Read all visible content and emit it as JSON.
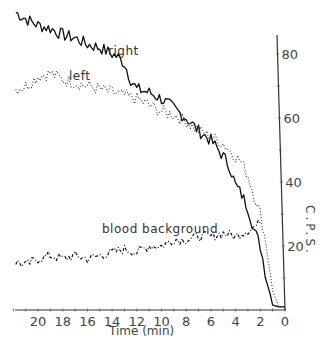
{
  "chart_data": {
    "type": "line",
    "title": "",
    "xlabel": "Time (min)",
    "ylabel": "C.P.S.",
    "x_reversed": true,
    "xlim": [
      22,
      0
    ],
    "ylim": [
      0,
      90
    ],
    "x_ticks": [
      20,
      18,
      16,
      14,
      12,
      10,
      8,
      6,
      4,
      2,
      0
    ],
    "y_ticks": [
      20,
      40,
      60,
      80
    ],
    "y_axis_position": "right",
    "grid": false,
    "legend": "inline labels",
    "series": [
      {
        "name": "right",
        "style": "solid",
        "x": [
          21.8,
          21,
          20,
          19,
          18,
          17,
          16,
          15,
          14,
          13.5,
          13,
          12.5,
          12,
          11,
          10,
          9,
          8,
          7,
          6,
          5,
          4.5,
          4,
          3.5,
          3,
          2.5,
          2,
          1.6,
          1.2,
          1.0,
          0.5,
          0
        ],
        "values": [
          93,
          91,
          89,
          88,
          86,
          85,
          83,
          82,
          80,
          79,
          77,
          72,
          69,
          68,
          66,
          63,
          60,
          56,
          53,
          48,
          45,
          39,
          36,
          32,
          25,
          20,
          12,
          5,
          1.5,
          1,
          1
        ]
      },
      {
        "name": "left",
        "style": "dotted",
        "x": [
          21.8,
          21,
          20,
          19,
          18,
          17,
          16,
          15,
          14,
          13,
          12,
          11,
          10,
          9,
          8,
          7,
          6,
          5,
          4,
          3.5,
          3,
          2.5,
          2,
          1.5,
          1.0,
          0.5,
          0
        ],
        "values": [
          69,
          70,
          73,
          74,
          72,
          71,
          70,
          69,
          68,
          67,
          66,
          64,
          62,
          61,
          59,
          56,
          54,
          52,
          48,
          46,
          42,
          36,
          30,
          20,
          6,
          1,
          1
        ]
      },
      {
        "name": "blood background",
        "style": "dash-dot",
        "x": [
          21.8,
          21,
          20,
          19,
          18,
          17,
          16,
          15,
          14,
          13,
          12,
          11,
          10,
          9,
          8,
          7,
          6,
          5,
          4,
          3,
          2.5,
          2
        ],
        "values": [
          15,
          14,
          16,
          17,
          16,
          17,
          16,
          17,
          18,
          19,
          18,
          20,
          20,
          22,
          22,
          23,
          23,
          24,
          23,
          25,
          26,
          27
        ]
      }
    ],
    "annotations": [
      "right",
      "left",
      "blood background"
    ]
  },
  "labels": {
    "x_axis_title": "Time (min)",
    "y_axis_title": "C.P.S.",
    "series_right": "right",
    "series_left": "left",
    "series_blood": "blood background"
  }
}
